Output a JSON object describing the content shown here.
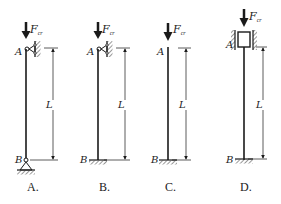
{
  "figure": {
    "force_label": "F",
    "force_subscript": "cr",
    "top_point": "A",
    "bottom_point": "B",
    "length_label": "L",
    "panels": [
      {
        "caption": "A.",
        "top_support": "pin (hinged to wall)",
        "bottom_support": "pin (hinged support)"
      },
      {
        "caption": "B.",
        "top_support": "pin (hinged to wall)",
        "bottom_support": "fixed"
      },
      {
        "caption": "C.",
        "top_support": "free",
        "bottom_support": "fixed"
      },
      {
        "caption": "D.",
        "top_support": "sliding guide (no rotation)",
        "bottom_support": "fixed"
      }
    ]
  },
  "colors": {
    "line": "#1a1a1a",
    "background": "#ffffff"
  }
}
